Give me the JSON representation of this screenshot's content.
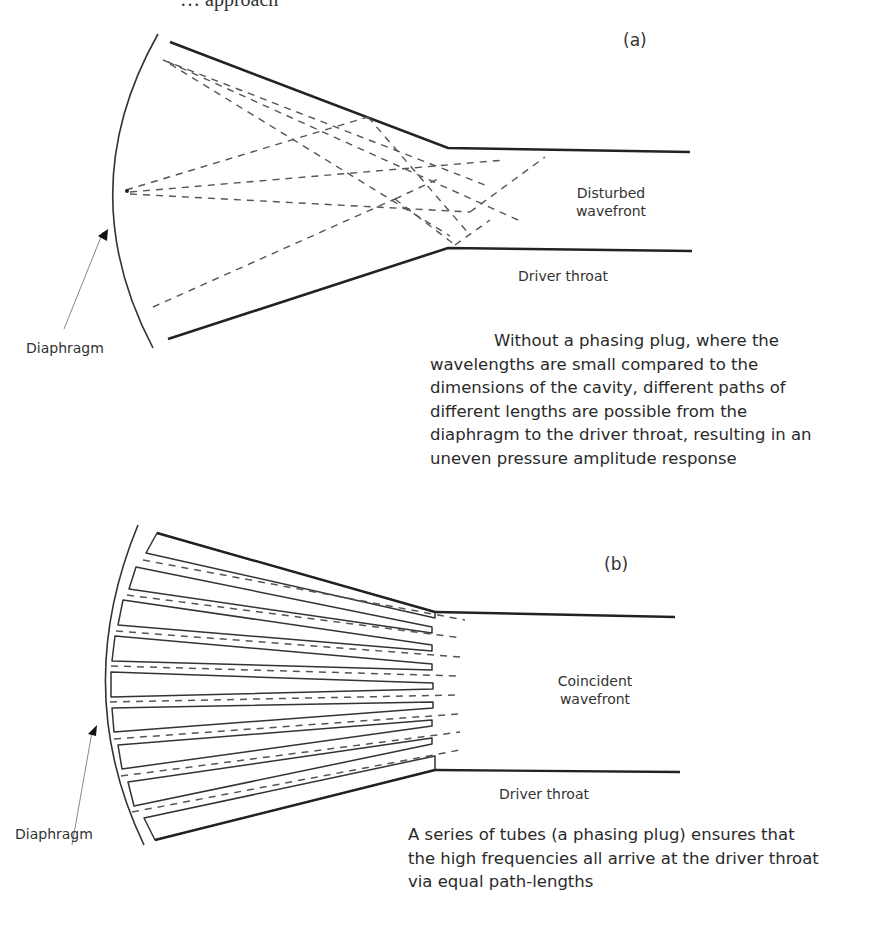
{
  "top_cut_text": "… approach",
  "panel_a": {
    "id_label": "(a)",
    "wavefront_label": [
      "Disturbed",
      "wavefront"
    ],
    "throat_label": "Driver throat",
    "diaphragm_label": "Diaphragm",
    "caption_lines": [
      "Without a phasing plug, where the",
      "wavelengths are small compared to the",
      "dimensions of the cavity, different paths of",
      "different lengths are possible from the",
      "diaphragm to the driver throat, resulting in an",
      "uneven pressure amplitude response"
    ]
  },
  "panel_b": {
    "id_label": "(b)",
    "wavefront_label": [
      "Coincident",
      "wavefront"
    ],
    "throat_label": "Driver throat",
    "diaphragm_label": "Diaphragm",
    "caption_lines": [
      "A series of tubes  (a phasing plug) ensures that",
      "the high frequencies all arrive at the driver throat",
      "via equal path-lengths"
    ],
    "tube_count": 9
  },
  "colors": {
    "line": "#222222",
    "dash": "#555555",
    "text": "#2a2a2a",
    "background": "#ffffff"
  }
}
